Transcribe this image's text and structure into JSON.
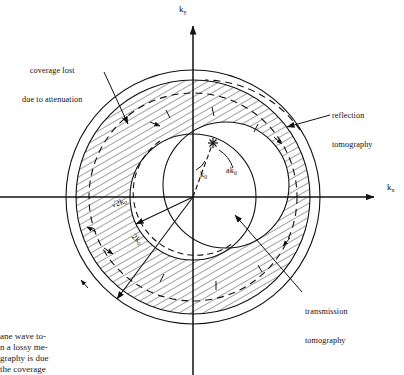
{
  "figure": {
    "background": "#ffffff",
    "ink": "#111111",
    "origin": {
      "x": 193,
      "y": 197
    }
  },
  "axes": {
    "x_label": "k",
    "x_sub": "x",
    "y_label": "k",
    "y_sub": "y",
    "x_axis_y": 197,
    "y_axis_x": 193,
    "x_range_px": [
      0,
      381
    ],
    "y_range_px": [
      20,
      375
    ]
  },
  "annotations": [
    {
      "name": "coverage-lost",
      "line1": "coverage lost",
      "line2": "due to attenuation",
      "text_x": 22,
      "text_y": 53,
      "leader": {
        "x1": 104,
        "y1": 72,
        "x2": 128,
        "y2": 124
      },
      "arrow": true
    },
    {
      "name": "reflection-tomography",
      "line1": "reflection",
      "line2": "tomography",
      "text_x": 332,
      "text_y": 97,
      "leader": {
        "x1": 330,
        "y1": 115,
        "x2": 287,
        "y2": 127
      },
      "arrow": true
    },
    {
      "name": "transmission-tomography",
      "line1": "transmission",
      "line2": "tomography",
      "text_x": 305,
      "text_y": 294,
      "leader": {
        "x1": 302,
        "y1": 292,
        "x2": 233,
        "y2": 214
      },
      "arrow": true
    }
  ],
  "radial_labels": [
    {
      "name": "sqrt2k0",
      "text": "√2k",
      "sub": "0",
      "x": 110,
      "y": 201,
      "rotation": -18,
      "vector_angle_deg": 205,
      "vector_len": 68
    },
    {
      "name": "2k0",
      "text": "2k",
      "sub": "0",
      "x": 136,
      "y": 232,
      "rotation": 42,
      "vector_angle_deg": 233,
      "vector_len": 127
    },
    {
      "name": "k0",
      "text": "k",
      "sub": "0",
      "x": 200,
      "y": 176,
      "rotation": 0
    },
    {
      "name": "ak0",
      "text": "ak",
      "sub": "0",
      "x": 225,
      "y": 172,
      "rotation": 0
    }
  ],
  "geometry": {
    "outer_circle": {
      "name": "outer-coverage-circle",
      "r": 127,
      "style": "solid"
    },
    "hatch_outer": {
      "name": "hatched-band-outer-edge",
      "r": 117,
      "style": "solid"
    },
    "hatch_inner": {
      "name": "hatched-band-inner-edge",
      "r": 63,
      "style": "solid"
    },
    "dashed_arc": {
      "name": "attenuation-limited-arc",
      "r": 104,
      "style": "dashed"
    },
    "transmission_disk": {
      "name": "transmission-tomography-circle",
      "r": 63,
      "cx_offset": 33,
      "cy_offset": -12,
      "style": "solid"
    },
    "star_marker": {
      "name": "k-vector-tip-star",
      "x": 213,
      "y": 143
    },
    "hatch_angle_deg": 60,
    "hatch_spacing_px": 6
  },
  "caption": {
    "lines": [
      "ane wave to-",
      "n a lossy me-",
      "graphy is due",
      "the coverage"
    ]
  }
}
